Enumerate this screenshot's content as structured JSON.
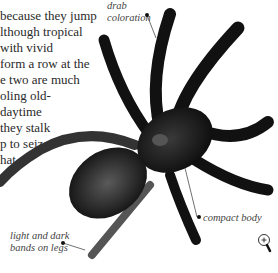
{
  "page": {
    "body_text_lines": [
      "because they jump",
      "lthough tropical",
      "with vivid",
      "form a row at the",
      "e two are much",
      "oling old-",
      "daytime",
      "they stalk",
      "p to seize",
      "hat"
    ],
    "annotations": {
      "drab_coloration": [
        "drab",
        "coloration"
      ],
      "light_dark_bands": [
        "light and dark",
        "bands on legs"
      ],
      "compact_body": "compact body"
    },
    "zoom_icon": "magnifier-plus-icon"
  }
}
